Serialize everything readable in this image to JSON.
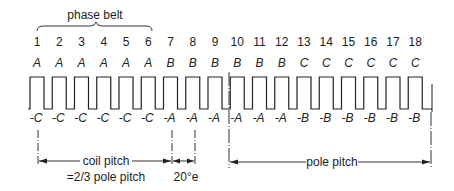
{
  "phase_belt_label": "phase belt",
  "slot_count": 18,
  "slots": [
    {
      "number": "1",
      "top": "A",
      "bottom": "-C"
    },
    {
      "number": "2",
      "top": "A",
      "bottom": "-C"
    },
    {
      "number": "3",
      "top": "A",
      "bottom": "-C"
    },
    {
      "number": "4",
      "top": "A",
      "bottom": "-C"
    },
    {
      "number": "5",
      "top": "A",
      "bottom": "-C"
    },
    {
      "number": "6",
      "top": "A",
      "bottom": "-C"
    },
    {
      "number": "7",
      "top": "B",
      "bottom": "-A"
    },
    {
      "number": "8",
      "top": "B",
      "bottom": "-A"
    },
    {
      "number": "9",
      "top": "B",
      "bottom": "-A"
    },
    {
      "number": "10",
      "top": "B",
      "bottom": "-A"
    },
    {
      "number": "11",
      "top": "B",
      "bottom": "-A"
    },
    {
      "number": "12",
      "top": "B",
      "bottom": "-A"
    },
    {
      "number": "13",
      "top": "C",
      "bottom": "-B"
    },
    {
      "number": "14",
      "top": "C",
      "bottom": "-B"
    },
    {
      "number": "15",
      "top": "C",
      "bottom": "-B"
    },
    {
      "number": "16",
      "top": "C",
      "bottom": "-B"
    },
    {
      "number": "17",
      "top": "C",
      "bottom": "-B"
    },
    {
      "number": "18",
      "top": "C",
      "bottom": "-B"
    }
  ],
  "annotations": {
    "coil_pitch": "coil pitch",
    "coil_pitch_eq": "=2/3 pole pitch",
    "slot_angle": "20°e",
    "pole_pitch": "pole pitch"
  },
  "colors": {
    "line": "#222222",
    "background": "#ffffff"
  }
}
